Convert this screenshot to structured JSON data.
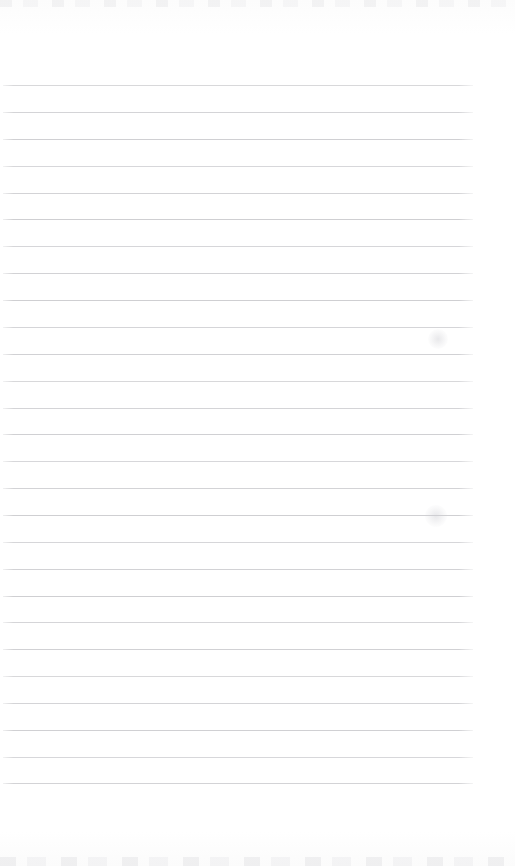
{
  "page": {
    "kind": "scanned-blank-lined-notebook-page",
    "width": 515,
    "height": 866,
    "background_color": "#fefefe",
    "has_visible_text": false,
    "visible_text": "",
    "header_text": "",
    "footer_text": "",
    "page_number_text": ""
  },
  "ruling": {
    "line_color": "#cfcfd2",
    "line_thickness_px": 1,
    "line_count": 27,
    "first_line_y": 85,
    "line_spacing_px": 26.9,
    "line_start_x": 3,
    "line_end_x": 473,
    "line_length_px": 470,
    "top_margin_px": 85,
    "bottom_margin_px": 83,
    "right_margin_px": 42,
    "margin_rule_present": false,
    "line_y_positions": [
      85,
      112,
      139,
      166,
      193,
      219,
      246,
      273,
      300,
      327,
      354,
      381,
      408,
      434,
      461,
      488,
      515,
      542,
      569,
      596,
      622,
      649,
      676,
      703,
      730,
      757,
      783
    ]
  },
  "artifacts": {
    "top_edge_noise_color": "#e4e4e6",
    "bottom_edge_noise_color": "#e2e2e5",
    "smudges": [
      {
        "name": "smudge-upper-right",
        "x": 438,
        "y": 339,
        "size": 20
      },
      {
        "name": "smudge-mid-right",
        "x": 436,
        "y": 516,
        "size": 22
      }
    ]
  }
}
